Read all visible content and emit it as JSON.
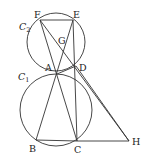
{
  "diagram": {
    "type": "geometry",
    "circles": [
      {
        "id": "C1",
        "label": "C",
        "subscript": "1",
        "cx": 56,
        "cy": 110,
        "r": 36,
        "label_x": 18,
        "label_y": 80
      },
      {
        "id": "C2",
        "label": "C",
        "subscript": "2",
        "cx": 56,
        "cy": 42,
        "r": 29,
        "label_x": 19,
        "label_y": 30
      }
    ],
    "points": [
      {
        "name": "F",
        "x": 40,
        "y": 20,
        "lx": 34,
        "ly": 18
      },
      {
        "name": "E",
        "x": 73,
        "y": 20,
        "lx": 73,
        "ly": 18
      },
      {
        "name": "G",
        "x": 62,
        "y": 40,
        "lx": 58,
        "ly": 44
      },
      {
        "name": "A",
        "x": 57,
        "y": 74,
        "lx": 45,
        "ly": 71
      },
      {
        "name": "D",
        "x": 76,
        "y": 66,
        "lx": 79,
        "ly": 71
      },
      {
        "name": "B",
        "x": 36,
        "y": 140,
        "lx": 29,
        "ly": 152
      },
      {
        "name": "C",
        "x": 77,
        "y": 141,
        "lx": 74,
        "ly": 153
      },
      {
        "name": "H",
        "x": 129,
        "y": 141,
        "lx": 132,
        "ly": 145
      }
    ],
    "segments": [
      [
        "F",
        "E"
      ],
      [
        "F",
        "C"
      ],
      [
        "F",
        "H"
      ],
      [
        "E",
        "B"
      ],
      [
        "E",
        "C"
      ],
      [
        "A",
        "D"
      ],
      [
        "B",
        "C"
      ],
      [
        "C",
        "H"
      ],
      [
        "D",
        "H"
      ]
    ]
  }
}
